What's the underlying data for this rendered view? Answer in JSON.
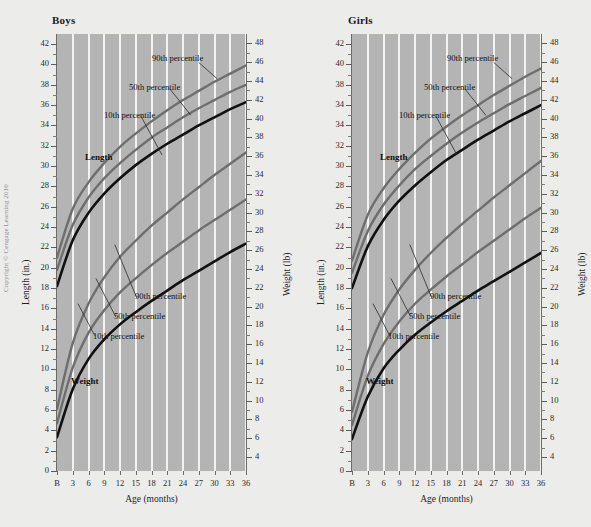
{
  "copyright": "Copyright © Cengage Learning 2010",
  "panels": [
    {
      "title": "Boys",
      "left_axis_title": "Length (in.)",
      "right_axis_title": "Weight (lb)",
      "x_axis_title": "Age (months)",
      "annotations": {
        "length_series": "Length",
        "weight_series": "Weight",
        "length_90": "90th percentile",
        "length_50": "50th percentile",
        "length_10": "10th percentile",
        "weight_90": "90th percentile",
        "weight_50": "50th percentile",
        "weight_10": "10th percentile"
      }
    },
    {
      "title": "Girls",
      "left_axis_title": "Length (in.)",
      "right_axis_title": "Weight (lb)",
      "x_axis_title": "Age (months)",
      "annotations": {
        "length_series": "Length",
        "weight_series": "Weight",
        "length_90": "90th percentile",
        "length_50": "50th percentile",
        "length_10": "10th percentile",
        "weight_90": "90th percentile",
        "weight_50": "50th percentile",
        "weight_10": "10th percentile"
      }
    }
  ],
  "chart_data": {
    "type": "line",
    "xlabel": "Age (months)",
    "x_ticklabels": [
      "B",
      "3",
      "6",
      "9",
      "12",
      "15",
      "18",
      "21",
      "24",
      "27",
      "30",
      "33",
      "36"
    ],
    "x": [
      0,
      3,
      6,
      9,
      12,
      15,
      18,
      21,
      24,
      27,
      30,
      33,
      36
    ],
    "xlim": [
      0,
      36
    ],
    "grid": "vertical-white",
    "legend": "inline-annotations",
    "colors": {
      "plot_background": "#b4b4b4",
      "gridline": "#f2f2f0",
      "page_background": "#ececeb",
      "percentile_90": "#6e6e6e",
      "percentile_50": "#6e6e6e",
      "percentile_10": "#111111"
    },
    "axes": {
      "left": {
        "label": "Length (in.)",
        "ylim": [
          0,
          43
        ],
        "ticklabels_boys": [
          "42",
          "40",
          "38",
          "36",
          "34",
          "32",
          "30",
          "28",
          "26",
          "24",
          "22",
          "20",
          "18",
          "16",
          "14",
          "12",
          "10",
          "8",
          "6",
          "4",
          "2",
          "0"
        ],
        "ticklabels_girls": [
          "42",
          "40",
          "38",
          "34",
          "34",
          "32",
          "30",
          "28",
          "26",
          "24",
          "22",
          "20",
          "18",
          "16",
          "14",
          "12",
          "10",
          "8",
          "6",
          "4",
          "2",
          "0"
        ],
        "tick_step": 2,
        "note": "Girls panel reproduces the original's printed tick sequence, where 36 appears as 34."
      },
      "right": {
        "label": "Weight (lb)",
        "ylim": [
          2.5,
          49
        ],
        "ticklabels": [
          "48",
          "46",
          "44",
          "42",
          "40",
          "38",
          "36",
          "34",
          "32",
          "30",
          "28",
          "26",
          "24",
          "22",
          "20",
          "18",
          "16",
          "14",
          "12",
          "10",
          "8",
          "6",
          "4"
        ],
        "tick_step": 2
      }
    },
    "panels": [
      {
        "name": "Boys",
        "series": [
          {
            "name": "Length 90th percentile",
            "axis": "left",
            "unit": "in.",
            "color": "#6e6e6e",
            "values": [
              21.0,
              25.8,
              28.4,
              30.3,
              31.9,
              33.2,
              34.4,
              35.5,
              36.5,
              37.4,
              38.3,
              39.1,
              39.9
            ]
          },
          {
            "name": "Length 50th percentile",
            "axis": "left",
            "unit": "in.",
            "color": "#6e6e6e",
            "values": [
              19.8,
              24.2,
              26.9,
              28.8,
              30.3,
              31.6,
              32.8,
              33.8,
              34.8,
              35.7,
              36.5,
              37.3,
              38.0
            ]
          },
          {
            "name": "Length 10th percentile",
            "axis": "left",
            "unit": "in.",
            "color": "#111111",
            "values": [
              18.2,
              22.7,
              25.4,
              27.3,
              28.8,
              30.1,
              31.2,
              32.2,
              33.1,
              34.0,
              34.8,
              35.6,
              36.3
            ]
          },
          {
            "name": "Weight 90th percentile",
            "axis": "right",
            "unit": "lb",
            "color": "#6e6e6e",
            "values": [
              9.1,
              16.1,
              20.3,
              23.1,
              25.3,
              27.0,
              28.6,
              30.0,
              31.4,
              32.7,
              34.0,
              35.2,
              36.4
            ]
          },
          {
            "name": "Weight 50th percentile",
            "axis": "right",
            "unit": "lb",
            "color": "#6e6e6e",
            "values": [
              7.6,
              13.5,
              17.2,
              19.6,
              21.5,
              23.0,
              24.4,
              25.7,
              26.9,
              28.1,
              29.2,
              30.3,
              31.4
            ]
          },
          {
            "name": "Weight 10th percentile",
            "axis": "right",
            "unit": "lb",
            "color": "#111111",
            "values": [
              6.1,
              11.2,
              14.4,
              16.5,
              18.1,
              19.4,
              20.6,
              21.7,
              22.8,
              23.8,
              24.8,
              25.8,
              26.7
            ]
          }
        ]
      },
      {
        "name": "Girls",
        "series": [
          {
            "name": "Length 90th percentile",
            "axis": "left",
            "unit": "in.",
            "color": "#6e6e6e",
            "values": [
              20.7,
              25.2,
              27.8,
              29.7,
              31.3,
              32.7,
              33.9,
              35.0,
              36.0,
              37.0,
              37.9,
              38.8,
              39.6
            ]
          },
          {
            "name": "Length 50th percentile",
            "axis": "left",
            "unit": "in.",
            "color": "#6e6e6e",
            "values": [
              19.5,
              23.6,
              26.2,
              28.1,
              29.7,
              31.0,
              32.2,
              33.3,
              34.3,
              35.2,
              36.1,
              36.9,
              37.7
            ]
          },
          {
            "name": "Length 10th percentile",
            "axis": "left",
            "unit": "in.",
            "color": "#111111",
            "values": [
              18.0,
              22.1,
              24.7,
              26.6,
              28.1,
              29.4,
              30.6,
              31.6,
              32.6,
              33.5,
              34.4,
              35.2,
              36.0
            ]
          },
          {
            "name": "Weight 90th percentile",
            "axis": "right",
            "unit": "lb",
            "color": "#6e6e6e",
            "values": [
              8.8,
              15.1,
              19.1,
              21.8,
              23.9,
              25.7,
              27.3,
              28.8,
              30.2,
              31.6,
              32.9,
              34.2,
              35.5
            ]
          },
          {
            "name": "Weight 50th percentile",
            "axis": "right",
            "unit": "lb",
            "color": "#6e6e6e",
            "values": [
              7.4,
              12.6,
              16.0,
              18.4,
              20.3,
              21.8,
              23.2,
              24.5,
              25.8,
              27.0,
              28.2,
              29.4,
              30.5
            ]
          },
          {
            "name": "Weight 10th percentile",
            "axis": "right",
            "unit": "lb",
            "color": "#111111",
            "values": [
              5.9,
              10.4,
              13.4,
              15.4,
              17.0,
              18.3,
              19.5,
              20.6,
              21.7,
              22.7,
              23.7,
              24.7,
              25.7
            ]
          }
        ]
      }
    ]
  }
}
